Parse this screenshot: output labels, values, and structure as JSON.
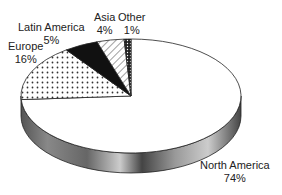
{
  "chart_data": {
    "type": "pie",
    "title": "",
    "style": "3d",
    "categories": [
      "North America",
      "Europe",
      "Latin America",
      "Asia",
      "Other"
    ],
    "values": [
      74,
      16,
      5,
      4,
      1
    ],
    "labels": [
      {
        "name": "North America",
        "pct": "74%"
      },
      {
        "name": "Europe",
        "pct": "16%"
      },
      {
        "name": "Latin America",
        "pct": "5%"
      },
      {
        "name": "Asia",
        "pct": "4%"
      },
      {
        "name": "Other",
        "pct": "1%"
      }
    ],
    "fills": {
      "North America": "white",
      "Europe": "dotted",
      "Latin America": "black",
      "Asia": "diagonal-hatch",
      "Other": "dense-dots"
    }
  }
}
